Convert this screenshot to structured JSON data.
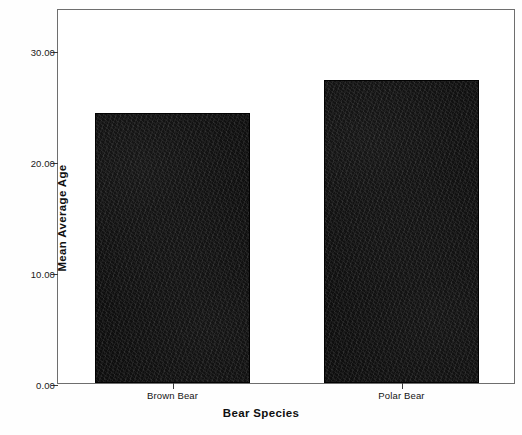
{
  "chart_data": {
    "type": "bar",
    "title": "",
    "subtitle": "",
    "categories": [
      "Brown Bear",
      "Polar Bear"
    ],
    "values": [
      24.3,
      27.3
    ],
    "series": [
      {
        "name": "Mean Average Age",
        "values": [
          24.3,
          27.3
        ]
      }
    ],
    "xlabel": "Bear Species",
    "ylabel": "Mean Average Age",
    "ylim": [
      0,
      33.8
    ],
    "yticks": [
      0,
      10,
      20,
      30
    ],
    "ytick_labels": [
      "0.00",
      "10.00",
      "20.00",
      "30.00"
    ],
    "xtick_labels": [
      "Brown Bear",
      "Polar Bear"
    ],
    "grid": false,
    "legend": false,
    "legend_position": "none",
    "bar_color": "#0d0d0d",
    "frame_color": "#6e6e6e",
    "background_color": "#ffffff"
  },
  "axes": {
    "y_title": "Mean Average Age",
    "x_title": "Bear Species",
    "y_ticks": [
      {
        "label": "30.00",
        "value": 30
      },
      {
        "label": "20.00",
        "value": 20
      },
      {
        "label": "10.00",
        "value": 10
      },
      {
        "label": "0.00",
        "value": 0
      }
    ],
    "x_ticks": [
      {
        "label": "Brown Bear"
      },
      {
        "label": "Polar Bear"
      }
    ]
  },
  "bars": [
    {
      "category": "Brown Bear",
      "value": 24.3
    },
    {
      "category": "Polar Bear",
      "value": 27.3
    }
  ]
}
